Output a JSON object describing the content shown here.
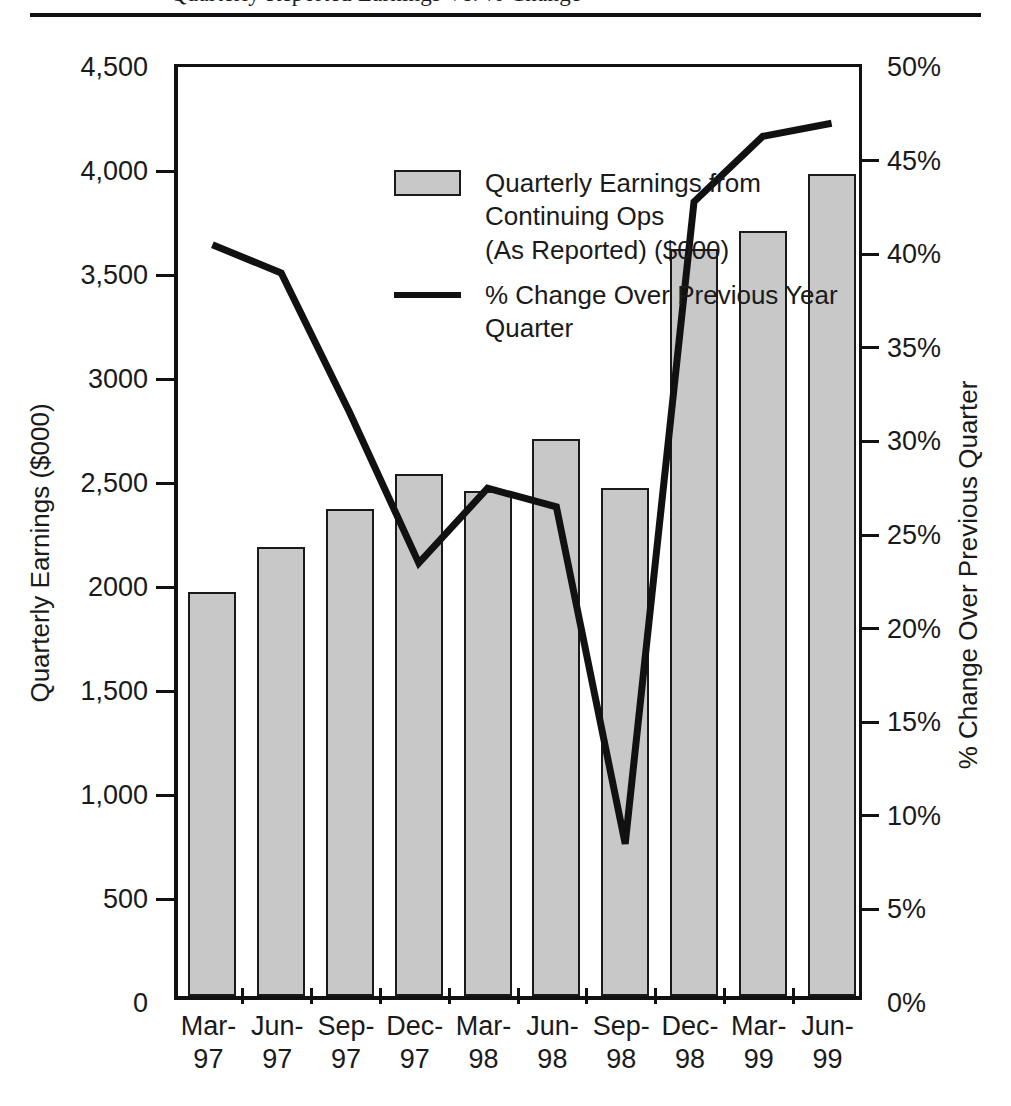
{
  "top_caption": {
    "text": "Quarterly Reported Earnings Vs. % Change"
  },
  "axis_titles": {
    "left": "Quarterly Earnings ($000)",
    "right": "% Change Over Previous Quarter"
  },
  "legend": {
    "items": [
      {
        "marker": "bar-swatch",
        "label_line1": "Quarterly Earnings from Continuing Ops",
        "label_line2": "(As Reported) ($000)"
      },
      {
        "marker": "line-swatch",
        "label_line1": "% Change Over Previous Year Quarter",
        "label_line2": ""
      }
    ]
  },
  "left_axis": {
    "ticks": [
      "4,500",
      "4,000",
      "3,500",
      "3000",
      "2,500",
      "2000",
      "1,500",
      "1,000",
      "500",
      "0"
    ],
    "values": [
      4500,
      4000,
      3500,
      3000,
      2500,
      2000,
      1500,
      1000,
      500,
      0
    ]
  },
  "right_axis": {
    "ticks": [
      "50%",
      "45%",
      "40%",
      "35%",
      "30%",
      "25%",
      "20%",
      "15%",
      "10%",
      "5%",
      "0%"
    ],
    "values": [
      50,
      45,
      40,
      35,
      30,
      25,
      20,
      15,
      10,
      5,
      0
    ]
  },
  "chart_data": {
    "type": "bar",
    "title": "Quarterly Reported Earnings Vs. % Change",
    "xlabel": "",
    "ylabel": "Quarterly Earnings ($000)",
    "y2label": "% Change Over Previous Quarter",
    "grid": false,
    "legend_position": "inside-top-left",
    "categories": [
      "Mar-97",
      "Jun-97",
      "Sep-97",
      "Dec-97",
      "Mar-98",
      "Jun-98",
      "Sep-98",
      "Dec-98",
      "Mar-99",
      "Jun-99"
    ],
    "category_lines": [
      [
        "Mar-",
        "97"
      ],
      [
        "Jun-",
        "97"
      ],
      [
        "Sep-",
        "97"
      ],
      [
        "Dec-",
        "97"
      ],
      [
        "Mar-",
        "98"
      ],
      [
        "Jun-",
        "98"
      ],
      [
        "Sep-",
        "98"
      ],
      [
        "Dec-",
        "98"
      ],
      [
        "Mar-",
        "99"
      ],
      [
        "Jun-",
        "99"
      ]
    ],
    "ylim": [
      0,
      4500
    ],
    "y2lim": [
      0,
      50
    ],
    "series": [
      {
        "name": "Quarterly Earnings from Continuing Ops (As Reported) ($000)",
        "type": "bar",
        "axis": "left",
        "color": "#c8c8c8",
        "edge_color": "#1a1a1a",
        "values": [
          1940,
          2160,
          2340,
          2510,
          2430,
          2680,
          2440,
          3590,
          3680,
          3950
        ]
      },
      {
        "name": "% Change Over Previous Year Quarter",
        "type": "line",
        "axis": "right",
        "color": "#111111",
        "values": [
          40.5,
          39.0,
          31.5,
          23.5,
          27.5,
          26.5,
          8.5,
          42.8,
          46.3,
          47.0
        ]
      }
    ]
  }
}
